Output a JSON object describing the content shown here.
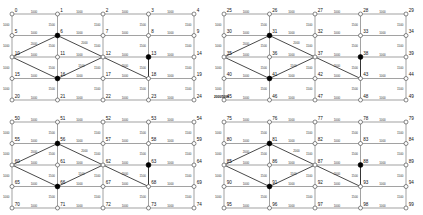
{
  "figure": {
    "title": "",
    "panel_count": 4,
    "grid_rows": 5,
    "grid_cols": 5,
    "cell_labels_per_panel": 25,
    "colors": {
      "edge": "#7a7a7a",
      "diagonal_edge": "#1a1a1a",
      "node_open_fill": "#ffffff",
      "node_open_stroke": "#555555",
      "node_filled": "#000000",
      "label_text": "#111111",
      "edge_label_text": "#333333",
      "background": "#ffffff"
    }
  },
  "chart_data": {
    "type": "diagram",
    "title": "",
    "xlabel": "",
    "ylabel": "",
    "capacity_values": [
      "1000",
      "1500",
      "2000",
      "5000",
      "2000/5000"
    ],
    "panels": [
      {
        "name": "top-left",
        "origin": [
          12,
          14
        ],
        "node_labels": [
          0,
          1,
          2,
          3,
          4,
          5,
          6,
          7,
          8,
          9,
          10,
          11,
          12,
          13,
          14,
          15,
          16,
          17,
          18,
          19,
          20,
          21,
          22,
          23,
          24
        ],
        "filled_nodes": [
          6,
          13,
          16
        ],
        "special_label": "",
        "special_label_node": null
      },
      {
        "name": "top-right",
        "origin": [
          224,
          14
        ],
        "node_labels": [
          25,
          26,
          27,
          28,
          29,
          30,
          31,
          32,
          33,
          34,
          35,
          36,
          37,
          38,
          39,
          40,
          41,
          42,
          43,
          44,
          45,
          46,
          47,
          48,
          49
        ],
        "filled_nodes": [
          31,
          38,
          41
        ],
        "special_label": "2000/5000",
        "special_label_node": 24
      },
      {
        "name": "bottom-left",
        "origin": [
          12,
          122
        ],
        "node_labels": [
          50,
          51,
          52,
          53,
          54,
          55,
          56,
          57,
          58,
          59,
          60,
          61,
          62,
          63,
          64,
          65,
          66,
          67,
          68,
          69,
          70,
          71,
          72,
          73,
          74
        ],
        "filled_nodes": [
          56,
          63,
          66
        ],
        "special_label": "",
        "special_label_node": null
      },
      {
        "name": "bottom-right",
        "origin": [
          224,
          122
        ],
        "node_labels": [
          75,
          76,
          77,
          78,
          79,
          80,
          81,
          82,
          83,
          84,
          85,
          86,
          87,
          88,
          89,
          90,
          91,
          92,
          93,
          94,
          95,
          96,
          97,
          98,
          99
        ],
        "filled_nodes": [
          81,
          88,
          91
        ],
        "special_label": "",
        "special_label_node": null
      }
    ],
    "edge_label_default": "1000",
    "edge_label_mid": "1500",
    "edge_label_high": "2000"
  }
}
